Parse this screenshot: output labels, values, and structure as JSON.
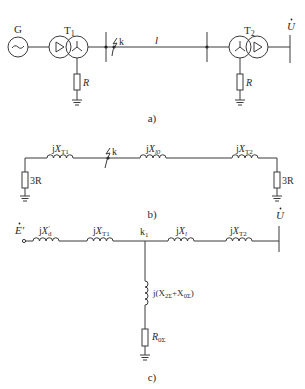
{
  "panel_a": {
    "caption": "a)",
    "generator_label": "G",
    "t1_label": "T",
    "t1_sub": "1",
    "t2_label": "T",
    "t2_sub": "2",
    "fault_label": "k",
    "line_label": "l",
    "r1_label": "R",
    "r2_label": "R",
    "voltage_label": "U",
    "voltage_dot": "·"
  },
  "panel_b": {
    "caption": "b)",
    "xt1_j": "j",
    "xt1_x": "X",
    "xt1_sub": "T1",
    "fault_label": "k",
    "xl0_j": "j",
    "xl0_x": "X",
    "xl0_sub": "l0",
    "xt2_j": "j",
    "xt2_x": "X",
    "xt2_sub": "T2",
    "r_left": "3R",
    "r_right": "3R"
  },
  "panel_c": {
    "caption": "c)",
    "emf_label": "E′",
    "xd_j": "j",
    "xd_x": "X",
    "xd_sub": "d",
    "xd_sup": "′",
    "xt1_j": "j",
    "xt1_x": "X",
    "xt1_sub": "T1",
    "node_label": "k",
    "node_sub": "1",
    "xl_j": "j",
    "xl_x": "X",
    "xl_sub": "l",
    "xt2_j": "j",
    "xt2_x": "X",
    "xt2_sub": "T2",
    "shunt_label_pre": "j(X",
    "shunt_sub1": "2Σ",
    "shunt_mid": "+X",
    "shunt_sub2": "0Σ",
    "shunt_post": ")",
    "r0_label": "R",
    "r0_sub": "0Σ",
    "voltage_label": "U"
  }
}
